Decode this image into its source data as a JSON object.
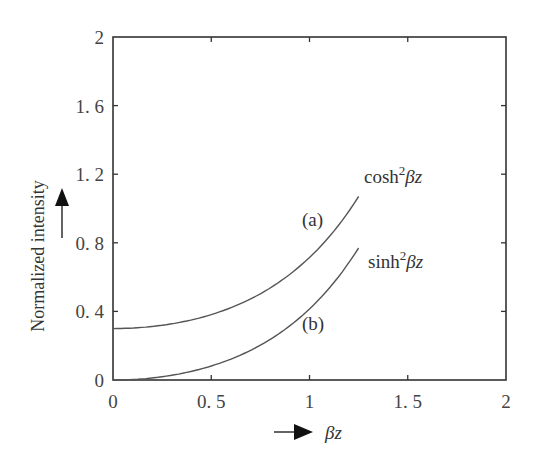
{
  "chart_data": {
    "type": "line",
    "title": "",
    "xlabel": "βz",
    "ylabel": "Normalized intensity",
    "xlim": [
      0,
      2
    ],
    "ylim": [
      0,
      2
    ],
    "xticks": [
      "0",
      "0. 5",
      "1",
      "1. 5",
      "2"
    ],
    "yticks": [
      "0",
      "0. 4",
      "0. 8",
      "1. 2",
      "1. 6",
      "2"
    ],
    "grid": false,
    "legend": "inline annotations",
    "series": [
      {
        "name": "cosh²βz",
        "tag": "(a)",
        "formula": "0.3*cosh^2(βz)",
        "x": [
          0,
          0.25,
          0.5,
          0.75,
          1.0,
          1.25
        ],
        "values": [
          0.3,
          0.32,
          0.38,
          0.49,
          0.71,
          1.07
        ]
      },
      {
        "name": "sinh²βz",
        "tag": "(b)",
        "formula": "0.3*sinh^2(βz)",
        "x": [
          0,
          0.25,
          0.5,
          0.75,
          1.0,
          1.25
        ],
        "values": [
          0.0,
          0.02,
          0.08,
          0.19,
          0.41,
          0.77
        ]
      }
    ]
  },
  "labels": {
    "curve_a_tag": "(a)",
    "curve_b_tag": "(b)",
    "curve_a_name": "cosh",
    "curve_b_name": "sinh",
    "superscript": "2",
    "beta": "β",
    "z": "z",
    "ylabel": "Normalized intensity"
  }
}
